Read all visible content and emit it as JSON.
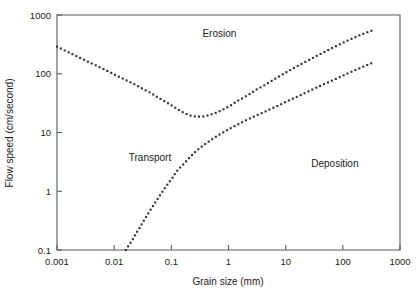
{
  "chart_data": {
    "type": "line",
    "title": "",
    "xlabel": "Grain size (mm)",
    "ylabel": "Flow speed (cm/second)",
    "xscale": "log",
    "yscale": "log",
    "xlim": [
      0.001,
      1000
    ],
    "ylim": [
      0.1,
      1000
    ],
    "xticks": [
      "0.001",
      "0.01",
      "0.1",
      "1",
      "10",
      "100",
      "1000"
    ],
    "xtick_values": [
      0.001,
      0.01,
      0.1,
      1,
      10,
      100,
      1000
    ],
    "yticks": [
      "0.1",
      "1",
      "10",
      "100",
      "1000"
    ],
    "ytick_values": [
      0.1,
      1,
      10,
      100,
      1000
    ],
    "grid": false,
    "legend": "none",
    "marker": "dotted",
    "annotations": [
      {
        "text": "Erosion",
        "x": 0.35,
        "y": 430
      },
      {
        "text": "Transport",
        "x": 0.018,
        "y": 3.3
      },
      {
        "text": "Deposition",
        "x": 28,
        "y": 2.6
      }
    ],
    "series": [
      {
        "name": "Erosion threshold (critical erosion velocity)",
        "points": [
          [
            0.001,
            290
          ],
          [
            0.0013,
            255
          ],
          [
            0.0017,
            225
          ],
          [
            0.0022,
            198
          ],
          [
            0.0029,
            175
          ],
          [
            0.0038,
            154
          ],
          [
            0.005,
            136
          ],
          [
            0.0065,
            120
          ],
          [
            0.0085,
            106
          ],
          [
            0.011,
            93
          ],
          [
            0.0145,
            82
          ],
          [
            0.019,
            72
          ],
          [
            0.025,
            63
          ],
          [
            0.032,
            55
          ],
          [
            0.042,
            48
          ],
          [
            0.055,
            41
          ],
          [
            0.072,
            35
          ],
          [
            0.095,
            30
          ],
          [
            0.12,
            26
          ],
          [
            0.16,
            22
          ],
          [
            0.21,
            19.5
          ],
          [
            0.28,
            18.5
          ],
          [
            0.37,
            18.8
          ],
          [
            0.48,
            20
          ],
          [
            0.63,
            22
          ],
          [
            0.83,
            25
          ],
          [
            1.1,
            29
          ],
          [
            1.4,
            34
          ],
          [
            1.9,
            40
          ],
          [
            2.5,
            47
          ],
          [
            3.2,
            55
          ],
          [
            4.3,
            64
          ],
          [
            5.6,
            75
          ],
          [
            7.4,
            88
          ],
          [
            9.7,
            103
          ],
          [
            12.7,
            119
          ],
          [
            16.7,
            138
          ],
          [
            22,
            159
          ],
          [
            29,
            183
          ],
          [
            38,
            210
          ],
          [
            50,
            240
          ],
          [
            65,
            275
          ],
          [
            86,
            313
          ],
          [
            113,
            355
          ],
          [
            148,
            400
          ],
          [
            194,
            450
          ],
          [
            255,
            500
          ],
          [
            335,
            550
          ]
        ]
      },
      {
        "name": "Deposition threshold (settling velocity)",
        "points": [
          [
            0.016,
            0.1
          ],
          [
            0.018,
            0.12
          ],
          [
            0.021,
            0.15
          ],
          [
            0.024,
            0.19
          ],
          [
            0.028,
            0.24
          ],
          [
            0.032,
            0.3
          ],
          [
            0.037,
            0.38
          ],
          [
            0.043,
            0.48
          ],
          [
            0.05,
            0.6
          ],
          [
            0.058,
            0.75
          ],
          [
            0.067,
            0.93
          ],
          [
            0.078,
            1.15
          ],
          [
            0.09,
            1.4
          ],
          [
            0.105,
            1.7
          ],
          [
            0.12,
            2.1
          ],
          [
            0.14,
            2.5
          ],
          [
            0.17,
            3.0
          ],
          [
            0.2,
            3.6
          ],
          [
            0.24,
            4.3
          ],
          [
            0.29,
            5.1
          ],
          [
            0.36,
            6.0
          ],
          [
            0.45,
            7.0
          ],
          [
            0.57,
            8.2
          ],
          [
            0.73,
            9.5
          ],
          [
            0.95,
            11
          ],
          [
            1.25,
            12.7
          ],
          [
            1.65,
            14.6
          ],
          [
            2.2,
            16.8
          ],
          [
            3.0,
            19.3
          ],
          [
            4.1,
            22
          ],
          [
            5.6,
            25.5
          ],
          [
            7.7,
            29
          ],
          [
            10.5,
            34
          ],
          [
            14.5,
            39
          ],
          [
            20,
            45
          ],
          [
            27,
            52
          ],
          [
            37,
            60
          ],
          [
            51,
            69
          ],
          [
            70,
            79
          ],
          [
            96,
            91
          ],
          [
            132,
            105
          ],
          [
            181,
            120
          ],
          [
            248,
            137
          ],
          [
            340,
            155
          ]
        ]
      }
    ]
  },
  "figure": {
    "plot_area": {
      "left": 57,
      "top": 15,
      "right": 400,
      "bottom": 250
    }
  }
}
